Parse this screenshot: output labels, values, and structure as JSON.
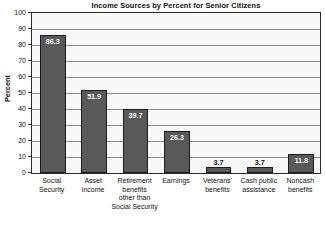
{
  "chart_data": {
    "type": "bar",
    "title": "Income Sources by Percent for Senior Citizens",
    "xlabel": "",
    "ylabel": "Percent",
    "ylim": [
      0,
      100
    ],
    "ytick_step": 10,
    "yticks": [
      "100",
      "90",
      "80",
      "70",
      "60",
      "50",
      "40",
      "30",
      "20",
      "10",
      "0"
    ],
    "grid": true,
    "legend": "none",
    "categories": [
      "Social Security",
      "Asset income",
      "Retirement benefits other than Social Security",
      "Earnings",
      "Veterans' benefits",
      "Cash public assistance",
      "Noncash benefits"
    ],
    "category_lines": [
      [
        "Social",
        "Security"
      ],
      [
        "Asset",
        "income"
      ],
      [
        "Retirement",
        "benefits",
        "other than",
        "Social Security"
      ],
      [
        "Earnings"
      ],
      [
        "Veterans'",
        "benefits"
      ],
      [
        "Cash public",
        "assistance"
      ],
      [
        "Noncash",
        "benefits"
      ]
    ],
    "values": [
      86.3,
      51.9,
      39.7,
      26.3,
      3.7,
      3.7,
      11.8
    ],
    "value_labels": [
      "86.3",
      "51.9",
      "39.7",
      "26.3",
      "3.7",
      "3.7",
      "11.8"
    ],
    "colors": {
      "bar_fill": "#595959",
      "bar_border": "#1c1c1c",
      "plot_background": "#f7f7f7",
      "gridline": "#8d8d8d",
      "axis": "#2b2b2b",
      "text": "#111111",
      "value_label_inside": "#ffffff"
    }
  }
}
